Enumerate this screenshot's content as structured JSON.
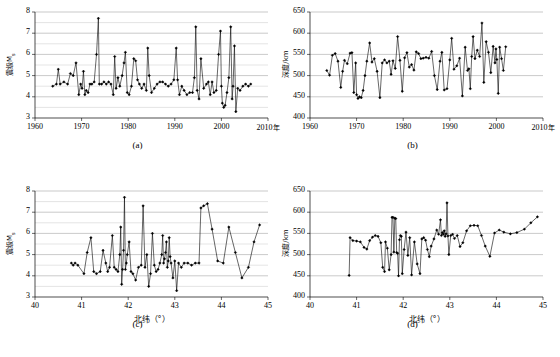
{
  "figure": {
    "panel_labels": {
      "a": "(a)",
      "b": "(b)",
      "c": "(c)",
      "d": "(d)"
    }
  },
  "chart_data": [
    {
      "type": "line",
      "panel": "(a)",
      "title": "",
      "xlabel": "年",
      "ylabel": "震级M",
      "ylabel_sub": "s",
      "xlim": [
        1960,
        2010
      ],
      "ylim": [
        3,
        8
      ],
      "xticks": [
        1960,
        1970,
        1980,
        1990,
        2000,
        2010
      ],
      "xtick_labels": [
        "1960",
        "1970",
        "1980",
        "1990",
        "2000",
        "2010年"
      ],
      "yticks": [
        3,
        4,
        5,
        6,
        7,
        8
      ],
      "ytick_labels": [
        "3",
        "4",
        "5",
        "6",
        "7",
        "8"
      ],
      "grid": "horizontal-major-and-minor",
      "minor_y_step": 0.5,
      "marker": "diamond",
      "x": [
        1963.8,
        1964.6,
        1965.0,
        1965.4,
        1966.2,
        1967.0,
        1967.6,
        1968.2,
        1968.8,
        1969.4,
        1969.8,
        1970.1,
        1970.4,
        1970.7,
        1971.0,
        1971.4,
        1971.8,
        1972.2,
        1972.7,
        1973.2,
        1973.6,
        1973.8,
        1974.3,
        1974.8,
        1975.3,
        1975.8,
        1976.3,
        1976.8,
        1977.1,
        1977.4,
        1977.8,
        1978.2,
        1978.7,
        1979.1,
        1979.4,
        1979.8,
        1980.2,
        1980.7,
        1981.2,
        1981.6,
        1982.0,
        1982.4,
        1982.9,
        1983.4,
        1983.9,
        1984.2,
        1984.5,
        1985.0,
        1985.6,
        1986.2,
        1986.8,
        1987.4,
        1988.0,
        1988.6,
        1989.2,
        1989.8,
        1990.3,
        1990.6,
        1991.0,
        1991.5,
        1992.0,
        1992.6,
        1993.2,
        1993.8,
        1994.2,
        1994.5,
        1994.8,
        1995.2,
        1995.6,
        1996.2,
        1996.8,
        1997.2,
        1997.6,
        1998.0,
        1998.4,
        1998.9,
        1999.4,
        1999.8,
        2000.0,
        2000.2,
        2000.5,
        2000.8,
        2001.2,
        2001.6,
        2002.0,
        2002.3,
        2002.5,
        2002.8,
        2003.1,
        2003.5,
        2004.0,
        2004.6,
        2005.2,
        2005.8,
        2006.3
      ],
      "y": [
        4.5,
        4.6,
        5.3,
        4.6,
        4.7,
        4.6,
        5.1,
        5.0,
        5.6,
        4.1,
        4.6,
        4.4,
        5.2,
        4.1,
        4.3,
        4.2,
        4.6,
        4.6,
        4.7,
        6.0,
        7.7,
        4.6,
        4.6,
        4.7,
        4.6,
        4.7,
        4.6,
        4.1,
        5.9,
        4.4,
        4.9,
        4.5,
        5.0,
        5.6,
        6.1,
        4.2,
        4.1,
        4.5,
        5.8,
        5.7,
        4.8,
        4.6,
        4.4,
        4.6,
        4.3,
        6.3,
        5.0,
        4.2,
        4.4,
        4.6,
        4.7,
        4.7,
        4.6,
        4.5,
        4.6,
        4.8,
        6.3,
        4.8,
        4.1,
        4.5,
        4.3,
        4.1,
        4.2,
        4.2,
        4.9,
        7.3,
        4.3,
        3.9,
        5.8,
        4.4,
        4.6,
        4.7,
        4.1,
        4.7,
        4.2,
        4.3,
        6.0,
        7.1,
        4.5,
        3.7,
        3.5,
        3.6,
        4.2,
        4.9,
        7.3,
        3.9,
        4.5,
        6.4,
        3.3,
        4.4,
        4.3,
        4.5,
        4.6,
        4.5,
        4.6
      ]
    },
    {
      "type": "line",
      "panel": "(b)",
      "title": "",
      "xlabel": "年",
      "ylabel": "深度/km",
      "xlim": [
        1960,
        2010
      ],
      "ylim": [
        400,
        650
      ],
      "xticks": [
        1960,
        1970,
        1980,
        1990,
        2000,
        2010
      ],
      "xtick_labels": [
        "1960",
        "1970",
        "1980",
        "1990",
        "2000",
        "2010年"
      ],
      "yticks": [
        400,
        450,
        500,
        550,
        600,
        650
      ],
      "ytick_labels": [
        "400",
        "450",
        "500",
        "550",
        "600",
        "650"
      ],
      "grid": "horizontal-major",
      "marker": "diamond",
      "x": [
        1963.6,
        1964.2,
        1964.8,
        1965.4,
        1966.0,
        1966.6,
        1967.0,
        1967.4,
        1968.0,
        1968.6,
        1969.0,
        1969.4,
        1969.8,
        1970.0,
        1970.3,
        1970.6,
        1971.0,
        1971.4,
        1971.8,
        1972.2,
        1972.8,
        1973.3,
        1973.8,
        1974.4,
        1975.0,
        1975.5,
        1976.0,
        1976.5,
        1977.0,
        1977.4,
        1977.8,
        1978.3,
        1978.8,
        1979.3,
        1979.8,
        1980.3,
        1980.8,
        1981.3,
        1981.8,
        1982.3,
        1982.8,
        1983.3,
        1983.8,
        1984.3,
        1984.9,
        1985.5,
        1986.1,
        1986.7,
        1987.3,
        1987.9,
        1988.3,
        1988.8,
        1989.4,
        1990.0,
        1990.4,
        1990.9,
        1991.5,
        1992.1,
        1992.7,
        1993.3,
        1993.8,
        1994.1,
        1994.4,
        1994.7,
        1995.0,
        1995.4,
        1995.9,
        1996.4,
        1996.9,
        1997.3,
        1997.8,
        1998.3,
        1998.8,
        1999.3,
        1999.7,
        1999.9,
        2000.1,
        2000.4,
        2000.7,
        2001.1,
        2001.5,
        2002.0,
        2002.4,
        2002.8,
        2003.2,
        2003.7,
        2004.2,
        2004.7,
        2005.2,
        2005.8,
        2006.3
      ],
      "y": [
        512,
        501,
        548,
        552,
        534,
        472,
        510,
        536,
        528,
        553,
        554,
        460,
        530,
        455,
        446,
        450,
        448,
        465,
        500,
        534,
        577,
        532,
        540,
        510,
        448,
        530,
        537,
        530,
        534,
        503,
        535,
        517,
        592,
        536,
        463,
        542,
        554,
        520,
        526,
        513,
        556,
        552,
        540,
        541,
        543,
        541,
        557,
        500,
        467,
        534,
        555,
        466,
        469,
        537,
        588,
        515,
        523,
        541,
        452,
        567,
        512,
        516,
        469,
        545,
        592,
        540,
        560,
        545,
        624,
        484,
        580,
        555,
        507,
        569,
        530,
        563,
        538,
        458,
        567,
        540,
        512,
        568
      ]
    },
    {
      "type": "line",
      "panel": "(c)",
      "title": "",
      "xlabel": "北纬（°）",
      "ylabel": "震级M",
      "ylabel_sub": "s",
      "xlim": [
        40,
        45
      ],
      "ylim": [
        3,
        8
      ],
      "xticks": [
        40,
        41,
        42,
        43,
        44,
        45
      ],
      "xtick_labels": [
        "40",
        "41",
        "42",
        "43",
        "44",
        "45"
      ],
      "yticks": [
        3,
        4,
        5,
        6,
        7,
        8
      ],
      "ytick_labels": [
        "3",
        "4",
        "5",
        "6",
        "7",
        "8"
      ],
      "grid": "horizontal-major-and-minor",
      "minor_y_step": 0.5,
      "marker": "diamond",
      "x": [
        40.78,
        40.82,
        40.86,
        40.92,
        41.05,
        41.12,
        41.2,
        41.26,
        41.32,
        41.4,
        41.46,
        41.52,
        41.56,
        41.6,
        41.66,
        41.7,
        41.74,
        41.78,
        41.82,
        41.84,
        41.86,
        41.88,
        41.9,
        41.92,
        41.94,
        41.96,
        41.98,
        42.02,
        42.06,
        42.1,
        42.16,
        42.22,
        42.28,
        42.32,
        42.36,
        42.4,
        42.44,
        42.48,
        42.52,
        42.56,
        42.6,
        42.64,
        42.68,
        42.72,
        42.74,
        42.76,
        42.78,
        42.8,
        42.82,
        42.84,
        42.86,
        42.88,
        42.9,
        42.92,
        42.96,
        43.0,
        43.04,
        43.08,
        43.14,
        43.2,
        43.28,
        43.36,
        43.44,
        43.52,
        43.56,
        43.62,
        43.7,
        43.8,
        43.92,
        44.04,
        44.16,
        44.3,
        44.44,
        44.58,
        44.7,
        44.82
      ],
      "y": [
        4.6,
        4.5,
        4.6,
        4.5,
        4.1,
        5.1,
        5.8,
        4.2,
        4.1,
        4.2,
        5.2,
        4.6,
        4.2,
        4.4,
        5.9,
        4.4,
        4.3,
        4.2,
        5.0,
        6.3,
        3.6,
        4.3,
        5.2,
        7.7,
        4.3,
        4.6,
        5.0,
        5.6,
        4.2,
        4.1,
        3.8,
        4.4,
        4.5,
        7.3,
        4.4,
        5.0,
        3.5,
        4.1,
        6.0,
        4.5,
        4.2,
        4.3,
        4.6,
        5.0,
        5.9,
        4.6,
        4.8,
        5.1,
        5.6,
        4.4,
        4.7,
        5.8,
        4.9,
        4.6,
        3.9,
        4.7,
        3.3,
        4.6,
        4.4,
        4.6,
        4.6,
        4.5,
        4.6,
        4.6,
        7.2,
        7.3,
        7.4,
        6.2,
        4.7,
        4.6,
        6.3,
        5.1,
        3.9,
        4.4,
        5.6,
        6.4
      ]
    },
    {
      "type": "line",
      "panel": "(d)",
      "title": "",
      "xlabel": "北纬（°）",
      "ylabel": "深度/km",
      "xlim": [
        40,
        45
      ],
      "ylim": [
        400,
        650
      ],
      "xticks": [
        40,
        41,
        42,
        43,
        44,
        45
      ],
      "xtick_labels": [
        "40",
        "41",
        "42",
        "43",
        "44",
        "45"
      ],
      "yticks": [
        400,
        450,
        500,
        550,
        600,
        650
      ],
      "ytick_labels": [
        "400",
        "450",
        "500",
        "550",
        "600",
        "650"
      ],
      "grid": "horizontal-major",
      "marker": "diamond",
      "x": [
        40.84,
        40.86,
        40.92,
        41.0,
        41.08,
        41.16,
        41.22,
        41.28,
        41.34,
        41.4,
        41.46,
        41.52,
        41.56,
        41.6,
        41.62,
        41.66,
        41.7,
        41.74,
        41.76,
        41.78,
        41.8,
        41.82,
        41.84,
        41.86,
        41.88,
        41.9,
        41.92,
        41.94,
        41.96,
        41.98,
        42.02,
        42.06,
        42.1,
        42.14,
        42.18,
        42.24,
        42.3,
        42.36,
        42.4,
        42.44,
        42.48,
        42.52,
        42.56,
        42.6,
        42.66,
        42.72,
        42.76,
        42.8,
        42.82,
        42.84,
        42.86,
        42.88,
        42.9,
        42.92,
        42.94,
        42.96,
        42.98,
        43.02,
        43.06,
        43.1,
        43.16,
        43.22,
        43.28,
        43.36,
        43.44,
        43.52,
        43.6,
        43.68,
        43.76,
        43.86,
        43.96,
        44.06,
        44.16,
        44.3,
        44.44,
        44.6,
        44.74,
        44.88
      ],
      "y": [
        451,
        540,
        533,
        532,
        530,
        517,
        513,
        533,
        541,
        545,
        543,
        528,
        470,
        460,
        530,
        515,
        464,
        500,
        588,
        588,
        506,
        586,
        585,
        505,
        503,
        450,
        535,
        545,
        543,
        455,
        512,
        553,
        498,
        540,
        452,
        530,
        478,
        455,
        537,
        540,
        534,
        512,
        495,
        520,
        537,
        558,
        548,
        582,
        545,
        552,
        548,
        556,
        543,
        549,
        622,
        544,
        500,
        545,
        548,
        538,
        545,
        519,
        528,
        556,
        568,
        569,
        568,
        545,
        520,
        496,
        551,
        558,
        553,
        549,
        552,
        560,
        575,
        589
      ]
    }
  ]
}
